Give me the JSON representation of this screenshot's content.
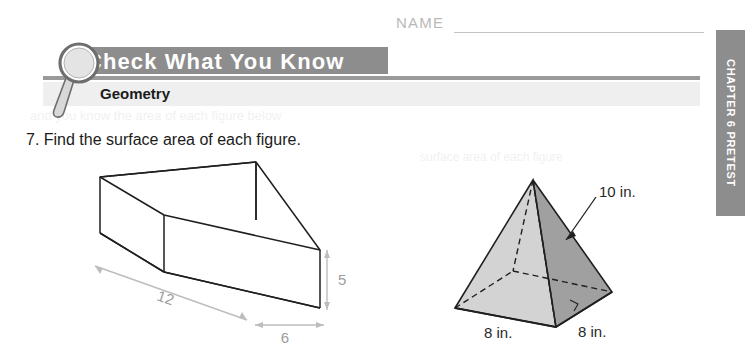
{
  "page": {
    "width": 756,
    "height": 364,
    "background": "#ffffff"
  },
  "name_field": {
    "label": "NAME",
    "value": ""
  },
  "header": {
    "title": "Check What You Know",
    "subtitle": "Geometry",
    "banner_color": "#8d8d8d",
    "subband_color": "#efefef",
    "title_color": "#ffffff"
  },
  "sidebar_tab": {
    "label": "CHAPTER 6 PRETEST",
    "color": "#8d8d8d",
    "text_color": "#ffffff"
  },
  "question": {
    "number": "7.",
    "text": "7. Find the surface area of each figure."
  },
  "figures": [
    {
      "id": "rectangular-prism",
      "type": "rectangular prism",
      "dimensions": [
        {
          "label": "12",
          "role": "length"
        },
        {
          "label": "6",
          "role": "width"
        },
        {
          "label": "5",
          "role": "height"
        }
      ],
      "line_color": "#1f1f1f",
      "dim_color": "#a5a5a5"
    },
    {
      "id": "square-pyramid",
      "type": "square pyramid",
      "dimensions": [
        {
          "label": "10 in.",
          "role": "slant height"
        },
        {
          "label": "8 in.",
          "role": "base edge front-left"
        },
        {
          "label": "8 in.",
          "role": "base edge front-right"
        }
      ],
      "face_light": "#d3d3d3",
      "face_dark": "#a0a0a0",
      "line_color": "#1f1f1f"
    }
  ]
}
